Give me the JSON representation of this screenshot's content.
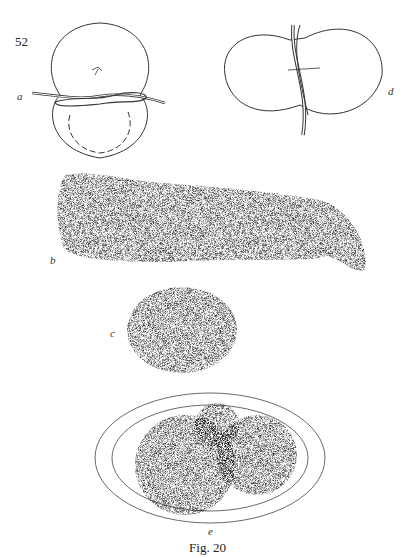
{
  "page": {
    "page_number": "52",
    "caption": "Fig. 20",
    "panels": [
      {
        "id": "a",
        "label": "a",
        "description": "constricted egg with ligature loop"
      },
      {
        "id": "d",
        "label": "d",
        "description": "two-lobed egg with vertical ligature"
      },
      {
        "id": "b",
        "label": "b",
        "description": "elongated stippled embryo"
      },
      {
        "id": "c",
        "label": "c",
        "description": "oval stippled embryo"
      },
      {
        "id": "e",
        "label": "e",
        "description": "embryo lobes in dish"
      }
    ]
  }
}
